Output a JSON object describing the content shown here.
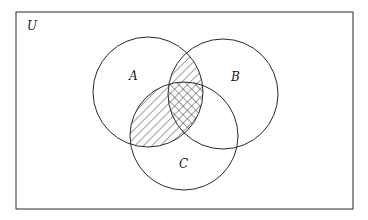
{
  "diagram": {
    "type": "venn",
    "universe_label": "U",
    "sets": [
      {
        "id": "A",
        "label": "A"
      },
      {
        "id": "B",
        "label": "B"
      },
      {
        "id": "C",
        "label": "C"
      }
    ],
    "shading": {
      "single_hatch": [
        "A∩B (outside C)",
        "A∩C (outside B)"
      ],
      "cross_hatch": [
        "A∩B∩C"
      ]
    },
    "colors": {
      "line": "#2a2a2a",
      "background": "#ffffff"
    }
  }
}
